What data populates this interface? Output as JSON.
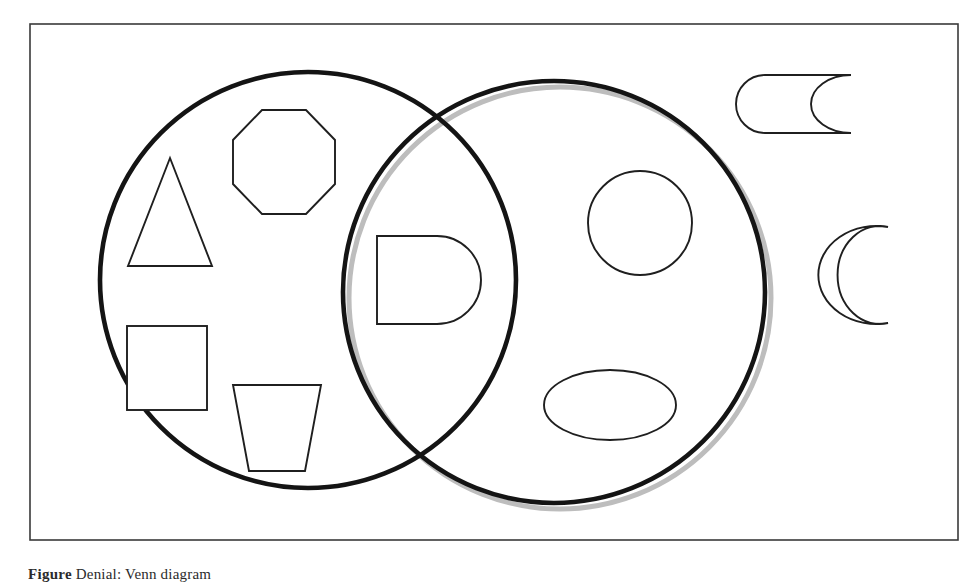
{
  "figure": {
    "frame": {
      "name": "figure-border",
      "x": 30,
      "y": 24,
      "width": 928,
      "height": 516,
      "stroke_color": "#3a3a3a",
      "stroke_width": 1.6,
      "fill_color": "#ffffff"
    },
    "caption": {
      "label": "Figure",
      "text": "Denial: Venn diagram"
    },
    "style": {
      "circle_stroke": "#1a1a1a",
      "circle_stroke_width": 4.5,
      "shadow_color": "#b9b9b9",
      "shadow_width": 4.5,
      "shape_stroke": "#1f1f1f",
      "shape_stroke_width": 1.8,
      "background": "#ffffff"
    },
    "sets": [
      {
        "name": "left-set-circle",
        "cx": 308,
        "cy": 280,
        "r": 208,
        "has_shadow": false
      },
      {
        "name": "right-set-circle",
        "cx": 554,
        "cy": 292,
        "r": 211,
        "has_shadow": true
      }
    ],
    "members": {
      "left_only": [
        {
          "name": "triangle-shape",
          "type": "triangle",
          "cx": 168,
          "cy": 212,
          "width": 84,
          "height": 108
        },
        {
          "name": "octagon-shape",
          "type": "octagon",
          "cx": 283,
          "cy": 162,
          "width": 102,
          "height": 106
        },
        {
          "name": "square-shape",
          "type": "square",
          "cx": 167,
          "cy": 368,
          "width": 80,
          "height": 84
        },
        {
          "name": "trapezoid-shape",
          "type": "trapezoid-inverted",
          "cx": 277,
          "cy": 428,
          "top_width": 88,
          "bottom_width": 56,
          "height": 86
        }
      ],
      "intersection": [
        {
          "name": "d-shape",
          "type": "half-stadium",
          "cx": 442,
          "cy": 280,
          "width": 122,
          "height": 88
        }
      ],
      "right_only": [
        {
          "name": "circle-shape",
          "type": "circle",
          "cx": 640,
          "cy": 223,
          "rx": 52,
          "ry": 52
        },
        {
          "name": "ellipse-shape",
          "type": "ellipse",
          "cx": 610,
          "cy": 405,
          "rx": 66,
          "ry": 35
        }
      ],
      "outside": [
        {
          "name": "tape-shape",
          "type": "rounded-concave-bar",
          "x": 737,
          "y": 75,
          "width": 142,
          "height": 57
        },
        {
          "name": "crescent-shape",
          "type": "crescent",
          "cx": 852,
          "cy": 275,
          "width": 72,
          "height": 98
        }
      ]
    }
  }
}
